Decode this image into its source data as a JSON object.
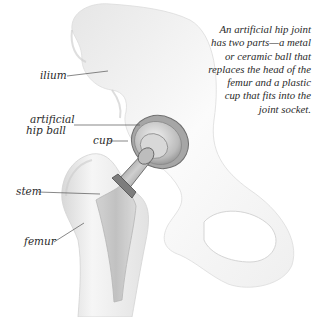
{
  "diagram": {
    "title": "Artificial hip joint",
    "caption_lines": [
      "An artificial hip joint",
      "has two parts—a metal",
      "or ceramic ball that",
      "replaces the head of the",
      "femur and a plastic",
      "cup that fits into the",
      "joint socket."
    ],
    "labels": {
      "ilium": "ilium",
      "ball_line1": "artificial",
      "ball_line2": "hip ball",
      "cup": "cup",
      "stem": "stem",
      "femur": "femur"
    },
    "colors": {
      "background": "#ffffff",
      "bone": "#f2f2f2",
      "bone_shadow": "#c9c9c9",
      "implant_metal": "#9a9a9a",
      "leader_line": "#555555",
      "text": "#2a2a2a"
    }
  }
}
